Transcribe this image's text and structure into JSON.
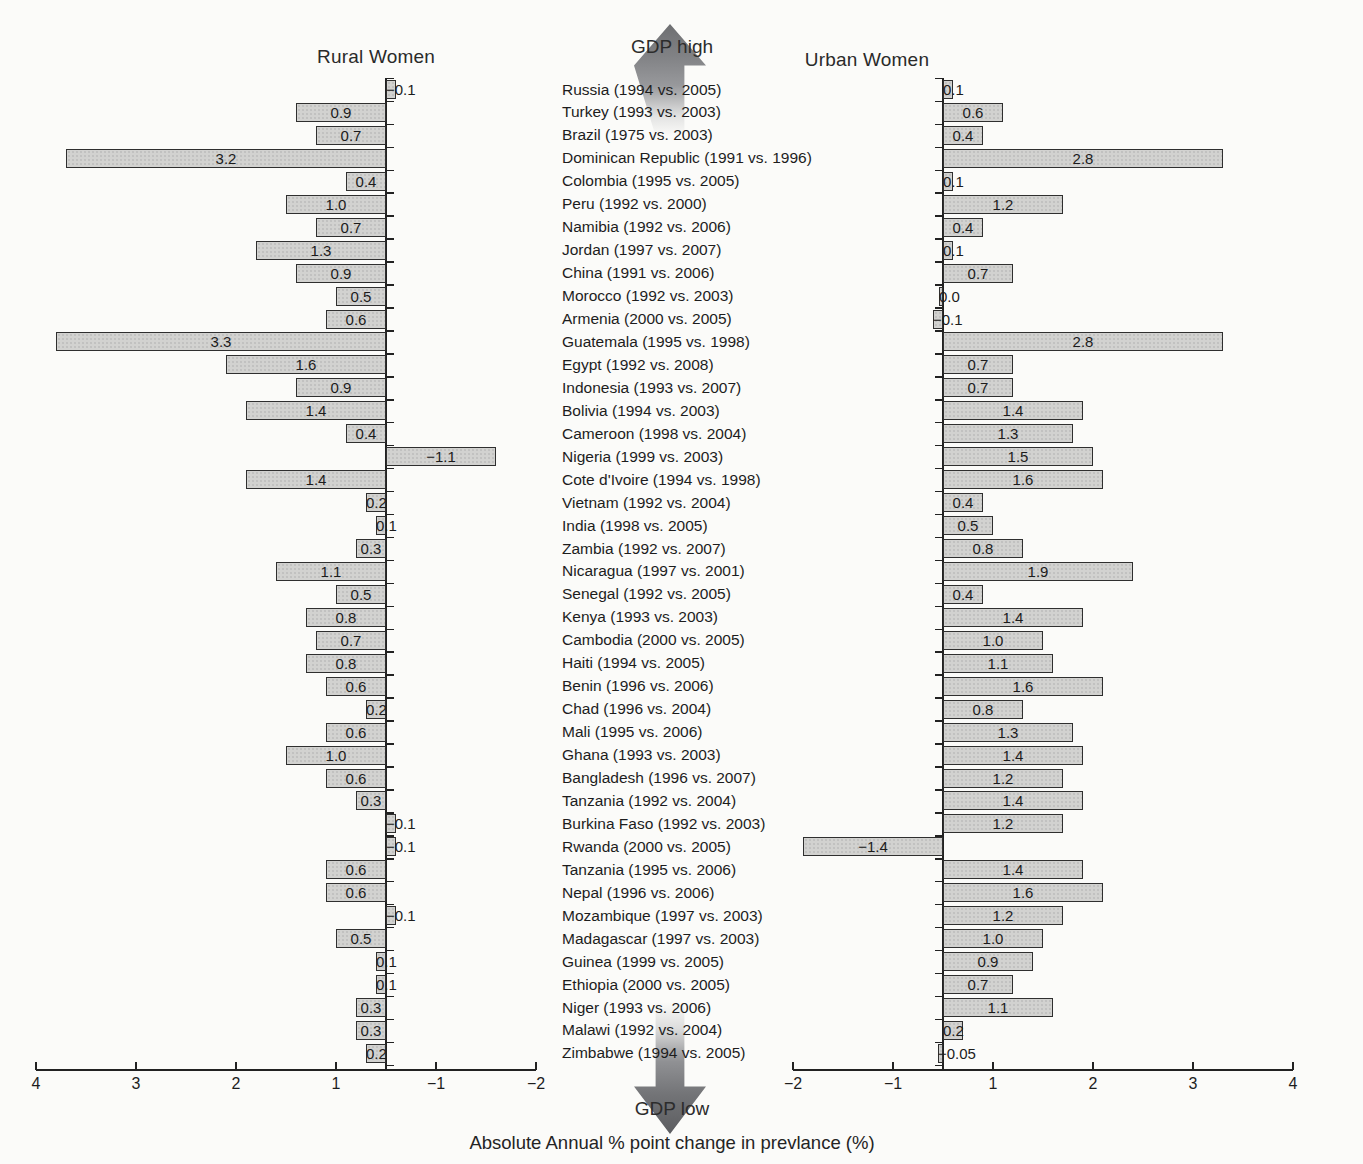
{
  "figure": {
    "left_panel_title": "Rural Women",
    "right_panel_title": "Urban Women",
    "top_annotation": "GDP high",
    "bottom_annotation": "GDP low",
    "x_axis_title": "Absolute Annual % point change in prevlance (%)"
  },
  "chart_data": {
    "type": "bar",
    "subtype": "paired-diverging-horizontal",
    "title": "",
    "xlabel": "Absolute Annual % point change in prevlance (%)",
    "ordering_top": "GDP high",
    "ordering_bottom": "GDP low",
    "grid": false,
    "legend_position": "none",
    "categories": [
      "Russia (1994 vs. 2005)",
      "Turkey (1993 vs. 2003)",
      "Brazil (1975 vs. 2003)",
      "Dominican Republic (1991 vs. 1996)",
      "Colombia (1995 vs. 2005)",
      "Peru (1992 vs. 2000)",
      "Namibia (1992 vs. 2006)",
      "Jordan (1997 vs. 2007)",
      "China (1991 vs. 2006)",
      "Morocco (1992 vs. 2003)",
      "Armenia (2000 vs. 2005)",
      "Guatemala (1995 vs. 1998)",
      "Egypt (1992 vs. 2008)",
      "Indonesia (1993 vs. 2007)",
      "Bolivia (1994 vs. 2003)",
      "Cameroon (1998 vs. 2004)",
      "Nigeria (1999 vs. 2003)",
      "Cote d'Ivoire (1994 vs. 1998)",
      "Vietnam (1992 vs. 2004)",
      "India (1998 vs. 2005)",
      "Zambia (1992 vs. 2007)",
      "Nicaragua (1997 vs. 2001)",
      "Senegal (1992 vs. 2005)",
      "Kenya (1993 vs. 2003)",
      "Cambodia (2000 vs. 2005)",
      "Haiti (1994 vs. 2005)",
      "Benin (1996 vs. 2006)",
      "Chad (1996 vs. 2004)",
      "Mali (1995 vs. 2006)",
      "Ghana (1993 vs. 2003)",
      "Bangladesh (1996 vs. 2007)",
      "Tanzania (1992 vs. 2004)",
      "Burkina Faso (1992 vs. 2003)",
      "Rwanda (2000 vs. 2005)",
      "Tanzania (1995 vs. 2006)",
      "Nepal (1996 vs. 2006)",
      "Mozambique (1997 vs. 2003)",
      "Madagascar (1997 vs. 2003)",
      "Guinea (1999 vs. 2005)",
      "Ethiopia (2000 vs. 2005)",
      "Niger (1993 vs. 2006)",
      "Malawi (1992 vs. 2004)",
      "Zimbabwe (1994 vs. 2005)"
    ],
    "series": [
      {
        "name": "Rural Women",
        "panel": "left",
        "positive_direction": "left",
        "values": [
          -0.1,
          0.9,
          0.7,
          3.2,
          0.4,
          1.0,
          0.7,
          1.3,
          0.9,
          0.5,
          0.6,
          3.3,
          1.6,
          0.9,
          1.4,
          0.4,
          -1.1,
          1.4,
          0.2,
          0.1,
          0.3,
          1.1,
          0.5,
          0.8,
          0.7,
          0.8,
          0.6,
          0.2,
          0.6,
          1.0,
          0.6,
          0.3,
          -0.1,
          -0.1,
          0.6,
          0.6,
          -0.1,
          0.5,
          0.1,
          0.1,
          0.3,
          0.3,
          0.2
        ],
        "labels": [
          "−0.1",
          "0.9",
          "0.7",
          "3.2",
          "0.4",
          "1.0",
          "0.7",
          "1.3",
          "0.9",
          "0.5",
          "0.6",
          "3.3",
          "1.6",
          "0.9",
          "1.4",
          "0.4",
          "−1.1",
          "1.4",
          "0.2",
          "0.1",
          "0.3",
          "1.1",
          "0.5",
          "0.8",
          "0.7",
          "0.8",
          "0.6",
          "0.2",
          "0.6",
          "1.0",
          "0.6",
          "0.3",
          "−0.1",
          "−0.1",
          "0.6",
          "0.6",
          "−0.1",
          "0.5",
          "0.1",
          "0.1",
          "0.3",
          "0.3",
          "0.2"
        ]
      },
      {
        "name": "Urban Women",
        "panel": "right",
        "positive_direction": "right",
        "values": [
          0.1,
          0.6,
          0.4,
          2.8,
          0.1,
          1.2,
          0.4,
          0.1,
          0.7,
          0.0,
          -0.1,
          2.8,
          0.7,
          0.7,
          1.4,
          1.3,
          1.5,
          1.6,
          0.4,
          0.5,
          0.8,
          1.9,
          0.4,
          1.4,
          1.0,
          1.1,
          1.6,
          0.8,
          1.3,
          1.4,
          1.2,
          1.4,
          1.2,
          -1.4,
          1.4,
          1.6,
          1.2,
          1.0,
          0.9,
          0.7,
          1.1,
          0.2,
          -0.05
        ],
        "labels": [
          "0.1",
          "0.6",
          "0.4",
          "2.8",
          "0.1",
          "1.2",
          "0.4",
          "0.1",
          "0.7",
          "0.0",
          "−0.1",
          "2.8",
          "0.7",
          "0.7",
          "1.4",
          "1.3",
          "1.5",
          "1.6",
          "0.4",
          "0.5",
          "0.8",
          "1.9",
          "0.4",
          "1.4",
          "1.0",
          "1.1",
          "1.6",
          "0.8",
          "1.3",
          "1.4",
          "1.2",
          "1.4",
          "1.2",
          "−1.4",
          "1.4",
          "1.6",
          "1.2",
          "1.0",
          "0.9",
          "0.7",
          "1.1",
          "0.2",
          "−0.05"
        ]
      }
    ],
    "x_axis": {
      "left_panel_tick_labels": [
        "4",
        "3",
        "2",
        "1",
        "−1",
        "−2"
      ],
      "right_panel_tick_labels": [
        "−2",
        "−1",
        "1",
        "2",
        "3",
        "4"
      ],
      "left_panel_range_note": "4 at far left to −2 at far right",
      "right_panel_range_note": "−2 at far left to 4 at far right"
    }
  },
  "colors": {
    "bar_fill": "#d2d2d0",
    "bar_border": "#2f2f2f",
    "background": "#fbfbf9",
    "text": "#1f1f1f",
    "axis": "#222222",
    "arrow_dark": "#5c5d60"
  }
}
